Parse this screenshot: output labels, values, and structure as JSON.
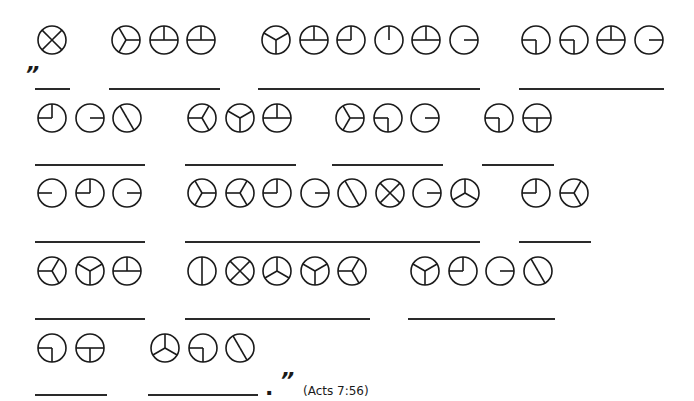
{
  "puzzle": {
    "type": "circle-cipher-fill-in-the-blanks",
    "reference": "(Acts 7:56)",
    "open_quote": "”",
    "close_quote": "”",
    "end_punct": ".",
    "glyph_spokes_deg": {
      "X": [
        45,
        135,
        225,
        315
      ],
      "Yr": [
        90,
        210,
        330
      ],
      "Th": [
        0,
        90,
        270
      ],
      "Ym": [
        300,
        60,
        180
      ],
      "QUL": [
        0,
        270
      ],
      "Iu": [
        0
      ],
      "Rr": [
        90
      ],
      "QDL": [
        180,
        270
      ],
      "Tb": [
        90,
        180,
        270
      ],
      "Sl": [
        330,
        150
      ],
      "Yl": [
        270,
        30,
        150
      ],
      "Ll": [
        270
      ],
      "Yup": [
        0,
        120,
        240
      ],
      "V": [
        0,
        180
      ]
    },
    "words": [
      {
        "glyphs": [
          "X"
        ],
        "cy": 40,
        "cx0": 52,
        "line": {
          "x": 35,
          "y": 88,
          "w": 35
        }
      },
      {
        "glyphs": [
          "Yr",
          "Th",
          "Th"
        ],
        "cy": 40,
        "cx0": 126,
        "line": {
          "x": 109,
          "y": 88,
          "w": 111
        }
      },
      {
        "glyphs": [
          "Ym",
          "Th",
          "QUL",
          "Iu",
          "Th",
          "Rr"
        ],
        "cy": 40,
        "cx0": 276,
        "line": {
          "x": 258,
          "y": 88,
          "w": 222
        }
      },
      {
        "glyphs": [
          "QDL",
          "QDL",
          "Th",
          "Rr"
        ],
        "cy": 40,
        "cx0": 536,
        "line": {
          "x": 519,
          "y": 88,
          "w": 145
        }
      },
      {
        "glyphs": [
          "QUL",
          "Rr",
          "Sl"
        ],
        "cy": 118,
        "cx0": 52,
        "line": {
          "x": 35,
          "y": 164,
          "w": 110
        }
      },
      {
        "glyphs": [
          "Yl",
          "Ym",
          "Th"
        ],
        "cy": 118,
        "cx0": 202,
        "line": {
          "x": 185,
          "y": 164,
          "w": 111
        }
      },
      {
        "glyphs": [
          "Yr",
          "QDL",
          "Rr"
        ],
        "cy": 118,
        "cx0": 350,
        "line": {
          "x": 332,
          "y": 164,
          "w": 111
        }
      },
      {
        "glyphs": [
          "QDL",
          "Tb"
        ],
        "cy": 118,
        "cx0": 499,
        "line": {
          "x": 482,
          "y": 164,
          "w": 72
        }
      },
      {
        "glyphs": [
          "Ll",
          "QUL",
          "Rr"
        ],
        "cy": 193,
        "cx0": 52,
        "line": {
          "x": 35,
          "y": 241,
          "w": 110
        }
      },
      {
        "glyphs": [
          "Yr",
          "Yl",
          "QUL",
          "Rr",
          "Sl",
          "X",
          "Rr",
          "Yup"
        ],
        "cy": 193,
        "cx0": 202,
        "line": {
          "x": 185,
          "y": 241,
          "w": 295
        }
      },
      {
        "glyphs": [
          "QUL",
          "Yl"
        ],
        "cy": 193,
        "cx0": 536,
        "line": {
          "x": 519,
          "y": 241,
          "w": 72
        }
      },
      {
        "glyphs": [
          "Yl",
          "Ym",
          "Th"
        ],
        "cy": 271,
        "cx0": 52,
        "line": {
          "x": 35,
          "y": 318,
          "w": 110
        }
      },
      {
        "glyphs": [
          "V",
          "X",
          "Yup",
          "Ym",
          "Yl"
        ],
        "cy": 271,
        "cx0": 202,
        "line": {
          "x": 185,
          "y": 318,
          "w": 185
        }
      },
      {
        "glyphs": [
          "Ym",
          "QUL",
          "Rr",
          "Sl"
        ],
        "cy": 271,
        "cx0": 425,
        "line": {
          "x": 408,
          "y": 318,
          "w": 147
        }
      },
      {
        "glyphs": [
          "QDL",
          "Tb"
        ],
        "cy": 348,
        "cx0": 52,
        "line": {
          "x": 35,
          "y": 394,
          "w": 72
        }
      },
      {
        "glyphs": [
          "Yup",
          "QDL",
          "Sl"
        ],
        "cy": 348,
        "cx0": 165,
        "line": {
          "x": 148,
          "y": 394,
          "w": 110
        }
      }
    ],
    "spacing": 37.5,
    "radius": 14
  }
}
